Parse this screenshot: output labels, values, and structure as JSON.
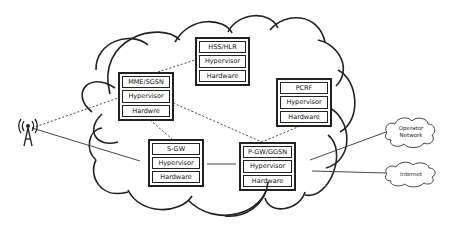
{
  "diagram": {
    "colors": {
      "stroke": "#222222",
      "background": "#ffffff"
    },
    "nodes": {
      "mme_sgsn": {
        "function": "MME/SGSN",
        "hypervisor": "Hypervisor",
        "hardware": "Hardwre"
      },
      "hss_hlr": {
        "function": "HSS/HLR",
        "hypervisor": "Hypervisor",
        "hardware": "Hardware"
      },
      "pcrf": {
        "function": "PCRF",
        "hypervisor": "Hypervisor",
        "hardware": "Hardware"
      },
      "s_gw": {
        "function": "S-GW",
        "hypervisor": "Hypervisor",
        "hardware": "Hardware"
      },
      "p_gw_ggsn": {
        "function": "P-GW/GGSN",
        "hypervisor": "Hypervisor",
        "hardware": "Hardware"
      }
    },
    "external": {
      "operator_network": {
        "line1": "Operator",
        "line2": "Network"
      },
      "internet": {
        "label": "Internet"
      },
      "antenna": {
        "icon": "cell-tower-icon"
      }
    },
    "connections": [
      {
        "from": "antenna",
        "to": "mme_sgsn",
        "style": "dashed"
      },
      {
        "from": "antenna",
        "to": "s_gw",
        "style": "solid"
      },
      {
        "from": "mme_sgsn",
        "to": "hss_hlr",
        "style": "dashed"
      },
      {
        "from": "mme_sgsn",
        "to": "s_gw",
        "style": "dashed"
      },
      {
        "from": "mme_sgsn",
        "to": "p_gw_ggsn",
        "style": "dashed"
      },
      {
        "from": "pcrf",
        "to": "p_gw_ggsn",
        "style": "dashed"
      },
      {
        "from": "s_gw",
        "to": "p_gw_ggsn",
        "style": "solid"
      },
      {
        "from": "p_gw_ggsn",
        "to": "operator_network",
        "style": "solid"
      },
      {
        "from": "p_gw_ggsn",
        "to": "internet",
        "style": "solid"
      }
    ]
  }
}
